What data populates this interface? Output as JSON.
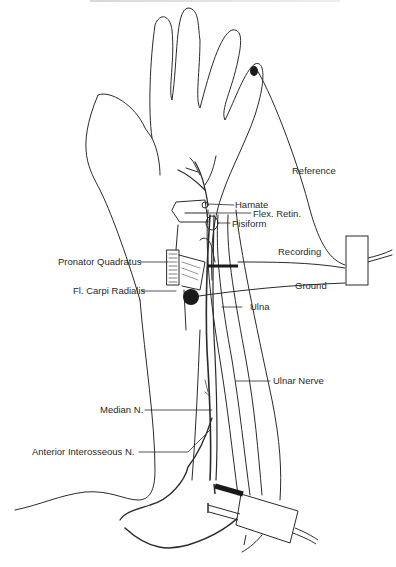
{
  "figure": {
    "type": "anatomical-diagram"
  },
  "labels": {
    "reference": "Reference",
    "hamate": "Hamate",
    "flex_retin": "Flex. Retin.",
    "pisiform": "Pisiform",
    "recording": "Recording",
    "pronator_quadratus": "Pronator Quadratus",
    "fl_carpi_radialis": "Fl. Carpi Radialis",
    "ground": "Ground",
    "ulna": "Ulna",
    "ulnar_nerve": "Ulnar Nerve",
    "median_n": "Median N.",
    "anterior_interosseous_n": "Anterior Interosseous N."
  },
  "colors": {
    "line": "#2a2a2a",
    "fill_dark": "#1a1a1a",
    "background": "#ffffff"
  }
}
